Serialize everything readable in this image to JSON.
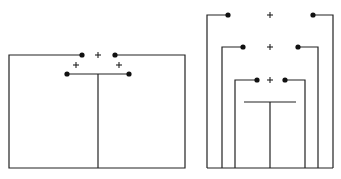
{
  "figure": {
    "colors": {
      "line": "#222222",
      "dot": "#111111",
      "background": "#ffffff"
    },
    "left_diagram": {
      "frame": {
        "left_x": 9,
        "right_x": 185,
        "top_y": 55,
        "bottom_y": 168
      },
      "top_terminals": [
        {
          "x": 82,
          "y": 55
        },
        {
          "x": 115,
          "y": 55
        }
      ],
      "top_plus": {
        "x": 98,
        "y": 55,
        "label": "+"
      },
      "side_plus": [
        {
          "x": 76,
          "y": 65,
          "label": "+"
        },
        {
          "x": 119,
          "y": 65,
          "label": "+"
        }
      ],
      "bar": {
        "x1": 67,
        "x2": 129,
        "y": 74
      },
      "bar_terminals": [
        {
          "x": 67,
          "y": 74
        },
        {
          "x": 129,
          "y": 74
        }
      ],
      "stem": {
        "x": 98,
        "y1": 74,
        "y2": 168
      }
    },
    "right_diagram": {
      "bottom_y": 168,
      "loops": [
        {
          "name": "outer",
          "left_x": 207,
          "right_x": 333,
          "y": 15,
          "left_dot_x": 228,
          "right_dot_x": 313,
          "plus_x": 270,
          "label": "+"
        },
        {
          "name": "middle",
          "left_x": 222,
          "right_x": 318,
          "y": 47,
          "left_dot_x": 243,
          "right_dot_x": 298,
          "plus_x": 270,
          "label": "+"
        },
        {
          "name": "inner",
          "left_x": 235,
          "right_x": 305,
          "y": 80,
          "left_dot_x": 257,
          "right_dot_x": 285,
          "plus_x": 270,
          "label": "+"
        }
      ],
      "bar": {
        "x1": 244,
        "x2": 296,
        "y": 102
      },
      "stem": {
        "x": 270,
        "y1": 102,
        "y2": 168
      }
    }
  }
}
